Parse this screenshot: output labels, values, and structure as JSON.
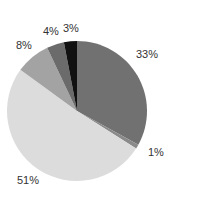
{
  "chart_data": {
    "type": "pie",
    "title": "",
    "start_angle": "12 o'clock, clockwise",
    "slices": [
      {
        "label": "33%",
        "value": 33,
        "color": "#717171"
      },
      {
        "label": "1%",
        "value": 1,
        "color": "#8a8a8a"
      },
      {
        "label": "51%",
        "value": 51,
        "color": "#dcdcdc"
      },
      {
        "label": "8%",
        "value": 8,
        "color": "#a3a3a3"
      },
      {
        "label": "4%",
        "value": 4,
        "color": "#6b6b6b"
      },
      {
        "label": "3%",
        "value": 3,
        "color": "#111111"
      }
    ],
    "legend": "none"
  },
  "labels": {
    "s0": "33%",
    "s1": "1%",
    "s2": "51%",
    "s3": "8%",
    "s4": "4%",
    "s5": "3%"
  }
}
